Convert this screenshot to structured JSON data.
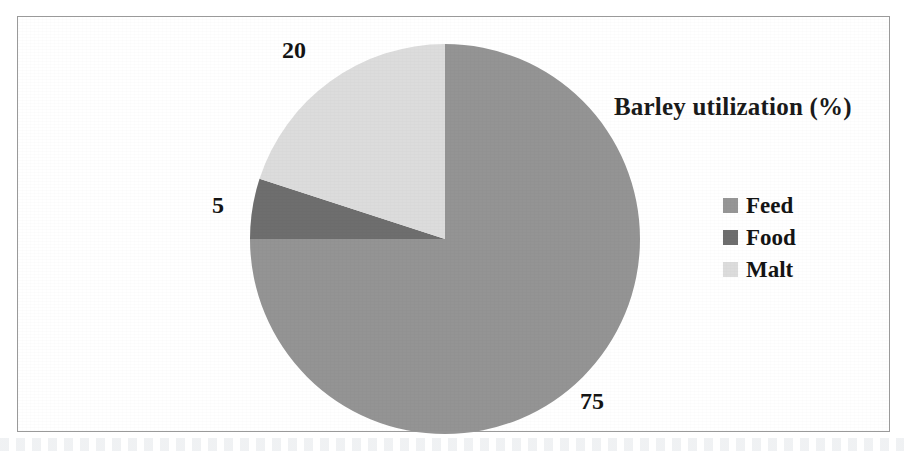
{
  "figure": {
    "title": "Barley utilization (%)",
    "border_color": "#9a9a9a",
    "background": "#ffffff"
  },
  "legend": {
    "position": "right",
    "items": [
      {
        "label": "Feed",
        "color": "#969696",
        "swatch_icon": "square-swatch-icon"
      },
      {
        "label": "Food",
        "color": "#6e6e6e",
        "swatch_icon": "square-swatch-icon"
      },
      {
        "label": "Malt",
        "color": "#dcdcdc",
        "swatch_icon": "square-swatch-icon"
      }
    ]
  },
  "labels": {
    "feed": "75",
    "food": "5",
    "malt": "20"
  },
  "chart_data": {
    "type": "pie",
    "title": "Barley utilization (%)",
    "xlabel": "",
    "ylabel": "",
    "categories": [
      "Feed",
      "Food",
      "Malt"
    ],
    "values": [
      75,
      5,
      20
    ],
    "units": "%",
    "colors": [
      "#949494",
      "#6e6e6e",
      "#dcdcdc"
    ],
    "data_labels": [
      "75",
      "5",
      "20"
    ],
    "start_angle_deg": 0,
    "direction": "clockwise",
    "legend": "right",
    "grid": false,
    "slices": [
      {
        "name": "Feed",
        "value": 75,
        "label": "75",
        "color": "#949494",
        "start_deg": 0,
        "end_deg": 270
      },
      {
        "name": "Food",
        "value": 5,
        "label": "5",
        "color": "#6e6e6e",
        "start_deg": 270,
        "end_deg": 288
      },
      {
        "name": "Malt",
        "value": 20,
        "label": "20",
        "color": "#dcdcdc",
        "start_deg": 288,
        "end_deg": 360
      }
    ]
  }
}
